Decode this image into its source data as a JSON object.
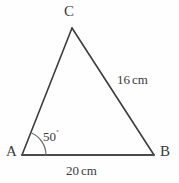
{
  "figure": {
    "type": "triangle-diagram",
    "background_color": "#fefefe",
    "stroke_color": "#3c3c3c",
    "text_color": "#3a3a3a"
  },
  "vertices": {
    "a": {
      "label": "A",
      "x": 22,
      "y": 155
    },
    "b": {
      "label": "B",
      "x": 154,
      "y": 155
    },
    "c": {
      "label": "C",
      "x": 72,
      "y": 28
    }
  },
  "angles": {
    "a": {
      "value": "50",
      "degree_symbol": "˚",
      "full_label": "50˚",
      "arc_radius": 24
    }
  },
  "sides": {
    "ab": {
      "value": "20",
      "unit": "cm",
      "full_label": "20 cm"
    },
    "bc": {
      "value": "16",
      "unit": "cm",
      "full_label": "16 cm"
    }
  }
}
